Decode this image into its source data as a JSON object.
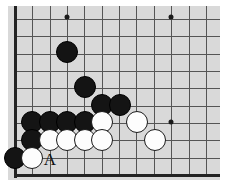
{
  "diagram": {
    "type": "go-board-diagram",
    "board": {
      "background_color": "#d9d9d9",
      "grid_color": "#555555",
      "edge_color": "#232323",
      "origin_x": 15,
      "origin_y": 17,
      "spacing": 17.35,
      "left_edge_x": 15,
      "bottom_edge_y": 175,
      "top_row_y": 17,
      "columns": 12,
      "rows": 10,
      "surface": {
        "left": 8,
        "top": 6,
        "width": 212,
        "height": 174
      }
    },
    "star_points": [
      {
        "name": "star-point-upper-left",
        "x": 67,
        "y": 17
      },
      {
        "name": "star-point-upper-right",
        "x": 171,
        "y": 17
      },
      {
        "name": "star-point-lower-right",
        "x": 171,
        "y": 122
      }
    ],
    "stones": [
      {
        "color": "black",
        "x": 67,
        "y": 52,
        "radius": 11,
        "label": ""
      },
      {
        "color": "black",
        "x": 85,
        "y": 87,
        "radius": 11,
        "label": ""
      },
      {
        "color": "black",
        "x": 102,
        "y": 105,
        "radius": 11,
        "label": ""
      },
      {
        "color": "black",
        "x": 120,
        "y": 105,
        "radius": 11,
        "label": ""
      },
      {
        "color": "black",
        "x": 32,
        "y": 122,
        "radius": 11,
        "label": ""
      },
      {
        "color": "black",
        "x": 50,
        "y": 122,
        "radius": 11,
        "label": ""
      },
      {
        "color": "black",
        "x": 67,
        "y": 122,
        "radius": 11,
        "label": ""
      },
      {
        "color": "black",
        "x": 85,
        "y": 122,
        "radius": 11,
        "label": ""
      },
      {
        "color": "white",
        "x": 102,
        "y": 122,
        "radius": 11,
        "label": ""
      },
      {
        "color": "white",
        "x": 137,
        "y": 122,
        "radius": 11,
        "label": ""
      },
      {
        "color": "black",
        "x": 32,
        "y": 140,
        "radius": 11,
        "label": ""
      },
      {
        "color": "white",
        "x": 50,
        "y": 140,
        "radius": 11,
        "label": ""
      },
      {
        "color": "white",
        "x": 67,
        "y": 140,
        "radius": 11,
        "label": ""
      },
      {
        "color": "white",
        "x": 85,
        "y": 140,
        "radius": 11,
        "label": ""
      },
      {
        "color": "white",
        "x": 102,
        "y": 140,
        "radius": 11,
        "label": ""
      },
      {
        "color": "white",
        "x": 155,
        "y": 140,
        "radius": 11,
        "label": ""
      },
      {
        "color": "black",
        "x": 15,
        "y": 158,
        "radius": 11,
        "label": ""
      },
      {
        "color": "white",
        "x": 32,
        "y": 158,
        "radius": 11,
        "label": ""
      }
    ],
    "labels": [
      {
        "name": "point-label-a",
        "text": "A",
        "x": 50,
        "y": 159
      }
    ]
  }
}
